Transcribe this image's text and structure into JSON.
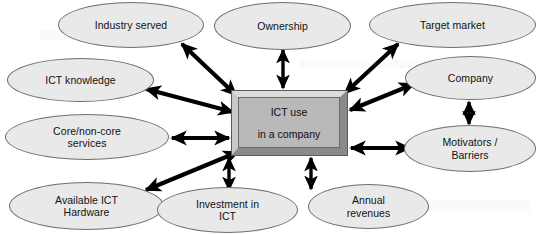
{
  "diagram": {
    "background_color": "#ffffff",
    "center": {
      "name": "center-node",
      "line1": "ICT use",
      "line2": "in a company",
      "fill": "#b9b9b9",
      "bevel_light": "#dcdcdc",
      "bevel_dark": "#8a8a8a",
      "border": "#5a5a5a"
    },
    "node_style": {
      "fill": "#e9e9e9",
      "border": "#6f6f6f",
      "text_color": "#111111"
    },
    "arrow_style": {
      "color": "#000000",
      "double_headed": true
    },
    "nodes": [
      {
        "id": "industry-served",
        "label": "Industry served",
        "x": 58,
        "y": 2,
        "w": 146,
        "h": 46
      },
      {
        "id": "ownership",
        "label": "Ownership",
        "x": 214,
        "y": 2,
        "w": 137,
        "h": 48
      },
      {
        "id": "target-market",
        "label": "Target market",
        "x": 369,
        "y": 2,
        "w": 167,
        "h": 46
      },
      {
        "id": "ict-knowledge",
        "label": "ICT knowledge",
        "x": 7,
        "y": 58,
        "w": 147,
        "h": 44
      },
      {
        "id": "company",
        "label": "Company",
        "x": 405,
        "y": 56,
        "w": 131,
        "h": 44
      },
      {
        "id": "core-non-core",
        "label": "Core/non-core\nservices",
        "x": 5,
        "y": 114,
        "w": 164,
        "h": 46
      },
      {
        "id": "motivators",
        "label": "Motivators /\nBarriers",
        "x": 404,
        "y": 125,
        "w": 132,
        "h": 47
      },
      {
        "id": "available-ict-hw",
        "label": "Available ICT\nHardware",
        "x": 9,
        "y": 182,
        "w": 155,
        "h": 48
      },
      {
        "id": "investment-ict",
        "label": "Investment in\nICT",
        "x": 157,
        "y": 187,
        "w": 141,
        "h": 46
      },
      {
        "id": "annual-revenues",
        "label": "Annual\nrevenues",
        "x": 308,
        "y": 184,
        "w": 121,
        "h": 45
      }
    ],
    "connections": [
      {
        "id": "conn-industry-served",
        "from": "center-node",
        "to": "industry-served",
        "x1": 236,
        "y1": 95,
        "x2": 182,
        "y2": 44
      },
      {
        "id": "conn-ownership",
        "from": "center-node",
        "to": "ownership",
        "x1": 283,
        "y1": 88,
        "x2": 283,
        "y2": 50
      },
      {
        "id": "conn-target-market",
        "from": "center-node",
        "to": "target-market",
        "x1": 345,
        "y1": 93,
        "x2": 398,
        "y2": 44
      },
      {
        "id": "conn-ict-knowledge",
        "from": "center-node",
        "to": "ict-knowledge",
        "x1": 233,
        "y1": 112,
        "x2": 146,
        "y2": 89
      },
      {
        "id": "conn-company",
        "from": "center-node",
        "to": "company",
        "x1": 350,
        "y1": 110,
        "x2": 414,
        "y2": 84
      },
      {
        "id": "conn-core-non-core",
        "from": "center-node",
        "to": "core-non-core",
        "x1": 229,
        "y1": 138,
        "x2": 172,
        "y2": 138
      },
      {
        "id": "conn-motivators",
        "from": "center-node",
        "to": "motivators",
        "x1": 351,
        "y1": 148,
        "x2": 410,
        "y2": 148
      },
      {
        "id": "conn-available-ict-hw",
        "from": "center-node",
        "to": "available-ict-hw",
        "x1": 238,
        "y1": 152,
        "x2": 146,
        "y2": 190
      },
      {
        "id": "conn-investment-ict",
        "from": "center-node",
        "to": "investment-ict",
        "x1": 229,
        "y1": 158,
        "x2": 229,
        "y2": 190
      },
      {
        "id": "conn-annual-revenues",
        "from": "center-node",
        "to": "annual-revenues",
        "x1": 311,
        "y1": 158,
        "x2": 311,
        "y2": 189
      },
      {
        "id": "conn-company-motivators",
        "from": "company",
        "to": "motivators",
        "x1": 469,
        "y1": 102,
        "x2": 469,
        "y2": 124
      }
    ]
  }
}
